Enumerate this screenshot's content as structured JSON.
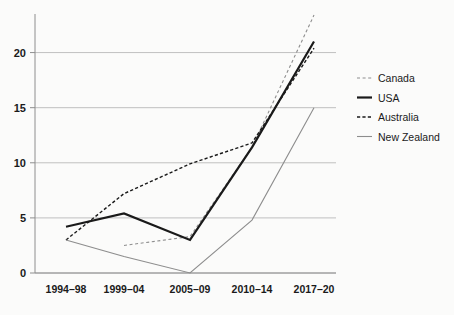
{
  "chart_data": {
    "type": "line",
    "title": "",
    "subtitle": "",
    "xlabel": "",
    "ylabel": "",
    "categories": [
      "1994–98",
      "1999–04",
      "2005–09",
      "2010–14",
      "2017–20"
    ],
    "ylim": [
      0,
      23.5
    ],
    "yticks": [
      0,
      5,
      10,
      15,
      20
    ],
    "ytick_labels": [
      "0",
      "5",
      "10",
      "15",
      "20"
    ],
    "grid": "horizontal",
    "legend_position": "right",
    "series": [
      {
        "name": "Canada",
        "style": "dashed",
        "color": "#8d8d8d",
        "width": 1.1,
        "x": [
          "1999–04",
          "2005–09",
          "2010–14",
          "2017–20"
        ],
        "values": [
          2.5,
          3.3,
          11.4,
          23.4
        ]
      },
      {
        "name": "USA",
        "style": "solid",
        "color": "#1a1a1a",
        "width": 2.2,
        "x": [
          "1994–98",
          "1999–04",
          "2005–09",
          "2010–14",
          "2017–20"
        ],
        "values": [
          4.2,
          5.4,
          3.0,
          11.4,
          21.0
        ]
      },
      {
        "name": "Australia",
        "style": "dashed",
        "color": "#1a1a1a",
        "width": 1.4,
        "x": [
          "1994–98",
          "1999–04",
          "2005–09",
          "2010–14",
          "2017–20"
        ],
        "values": [
          3.0,
          7.2,
          9.9,
          11.8,
          20.4
        ]
      },
      {
        "name": "New Zealand",
        "style": "solid",
        "color": "#8d8d8d",
        "width": 1.1,
        "x": [
          "1994–98",
          "1999–04",
          "2005–09",
          "2010–14",
          "2017–20"
        ],
        "values": [
          3.0,
          1.5,
          0.0,
          4.8,
          15.0
        ]
      }
    ]
  },
  "legend": {
    "items": [
      {
        "label": "Canada"
      },
      {
        "label": "USA"
      },
      {
        "label": "Australia"
      },
      {
        "label": "New Zealand"
      }
    ]
  }
}
